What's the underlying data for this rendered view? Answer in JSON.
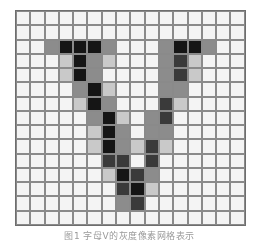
{
  "figure": {
    "rows": 15,
    "cols": 16,
    "shade_colors": [
      "#f4f4f4",
      "#c9c9c9",
      "#8c8c8c",
      "#3a3a3a",
      "#151515"
    ],
    "grid": [
      [
        0,
        0,
        0,
        0,
        0,
        0,
        0,
        0,
        0,
        0,
        0,
        0,
        0,
        0,
        0,
        0
      ],
      [
        0,
        0,
        0,
        0,
        0,
        0,
        0,
        0,
        0,
        0,
        0,
        0,
        0,
        0,
        0,
        0
      ],
      [
        0,
        0,
        2,
        4,
        4,
        4,
        2,
        0,
        0,
        0,
        2,
        4,
        4,
        2,
        0,
        0
      ],
      [
        0,
        0,
        0,
        1,
        4,
        2,
        1,
        0,
        0,
        0,
        2,
        3,
        1,
        0,
        0,
        0
      ],
      [
        0,
        0,
        0,
        1,
        4,
        2,
        0,
        0,
        0,
        0,
        2,
        3,
        1,
        0,
        0,
        0
      ],
      [
        0,
        0,
        0,
        0,
        2,
        4,
        1,
        0,
        0,
        0,
        2,
        2,
        0,
        0,
        0,
        0
      ],
      [
        0,
        0,
        0,
        0,
        1,
        4,
        2,
        0,
        0,
        0,
        3,
        1,
        0,
        0,
        0,
        0
      ],
      [
        0,
        0,
        0,
        0,
        0,
        2,
        4,
        1,
        0,
        2,
        3,
        0,
        0,
        0,
        0,
        0
      ],
      [
        0,
        0,
        0,
        0,
        0,
        1,
        4,
        2,
        0,
        2,
        2,
        0,
        0,
        0,
        0,
        0
      ],
      [
        0,
        0,
        0,
        0,
        0,
        1,
        4,
        2,
        1,
        3,
        1,
        0,
        0,
        0,
        0,
        0
      ],
      [
        0,
        0,
        0,
        0,
        0,
        0,
        3,
        3,
        0,
        3,
        0,
        0,
        0,
        0,
        0,
        0
      ],
      [
        0,
        0,
        0,
        0,
        0,
        0,
        1,
        4,
        3,
        2,
        0,
        0,
        0,
        0,
        0,
        0
      ],
      [
        0,
        0,
        0,
        0,
        0,
        0,
        0,
        3,
        4,
        1,
        0,
        0,
        0,
        0,
        0,
        0
      ],
      [
        0,
        0,
        0,
        0,
        0,
        0,
        0,
        2,
        3,
        0,
        0,
        0,
        0,
        0,
        0,
        0
      ],
      [
        0,
        0,
        0,
        0,
        0,
        0,
        0,
        0,
        0,
        0,
        0,
        0,
        0,
        0,
        0,
        0
      ]
    ],
    "caption": "图1 字母V的灰度像素网格表示"
  }
}
